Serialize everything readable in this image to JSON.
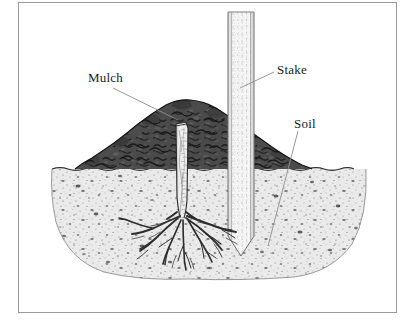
{
  "figure": {
    "type": "line-drawing-illustration",
    "frame": {
      "border_color": "#9a9a9a",
      "background_color": "#ffffff"
    },
    "labels": [
      {
        "id": "mulch",
        "text": "Mulch",
        "x": 88,
        "y": 70,
        "leader_from": [
          132,
          86
        ],
        "leader_to": [
          178,
          118
        ]
      },
      {
        "id": "stake",
        "text": "Stake",
        "x": 277,
        "y": 62,
        "leader_from": [
          274,
          72
        ],
        "leader_to": [
          240,
          88
        ]
      },
      {
        "id": "soil",
        "text": "Soil",
        "x": 294,
        "y": 116,
        "leader_from": [
          298,
          130
        ],
        "leader_to": [
          270,
          245
        ]
      }
    ],
    "elements": {
      "mulch": {
        "name": "mulch-mound",
        "color": "#4a4a4a",
        "outline_color": "#1f1f1f",
        "span_x": [
          75,
          312
        ],
        "peak_y": 100,
        "base_y": 169
      },
      "soil": {
        "name": "soil-mass",
        "color": "#e9e9e9",
        "speckle_color": "#5a5a5a",
        "span_x": [
          52,
          366
        ],
        "top_y": 169,
        "bottom_y": 277
      },
      "stake": {
        "name": "support-stake",
        "color": "#f4f4f4",
        "outline_color": "#7c7c7c",
        "span_x": [
          228,
          254
        ],
        "top_y": 12,
        "tip_y": 256
      },
      "trunk": {
        "name": "tree-trunk",
        "color": "#ededed",
        "outline_color": "#3a3a3a",
        "span_x": [
          176,
          188
        ],
        "top_y": 122,
        "base_y": 218
      },
      "roots": {
        "name": "root-system",
        "color": "#2e2e2e",
        "crown": [
          184,
          218
        ],
        "spread_x": [
          118,
          242
        ],
        "depth_y": 272
      },
      "ground_line": {
        "name": "ground-surface-line",
        "y": 169,
        "color": "#3a3a3a"
      }
    }
  }
}
